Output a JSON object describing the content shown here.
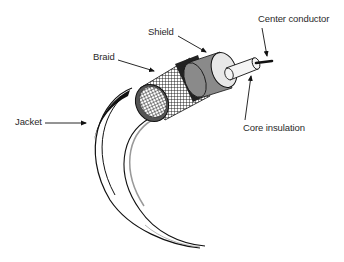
{
  "diagram": {
    "labels": {
      "center_conductor": "Center conductor",
      "shield": "Shield",
      "braid": "Braid",
      "jacket": "Jacket",
      "core_insulation": "Core insulation"
    },
    "colors": {
      "ink": "#111111",
      "shield_gray": "#8a8a8a",
      "dark_ring": "#555555",
      "insulation": "#e8e8e8",
      "core": "#f4f4f4",
      "background": "#ffffff"
    }
  }
}
